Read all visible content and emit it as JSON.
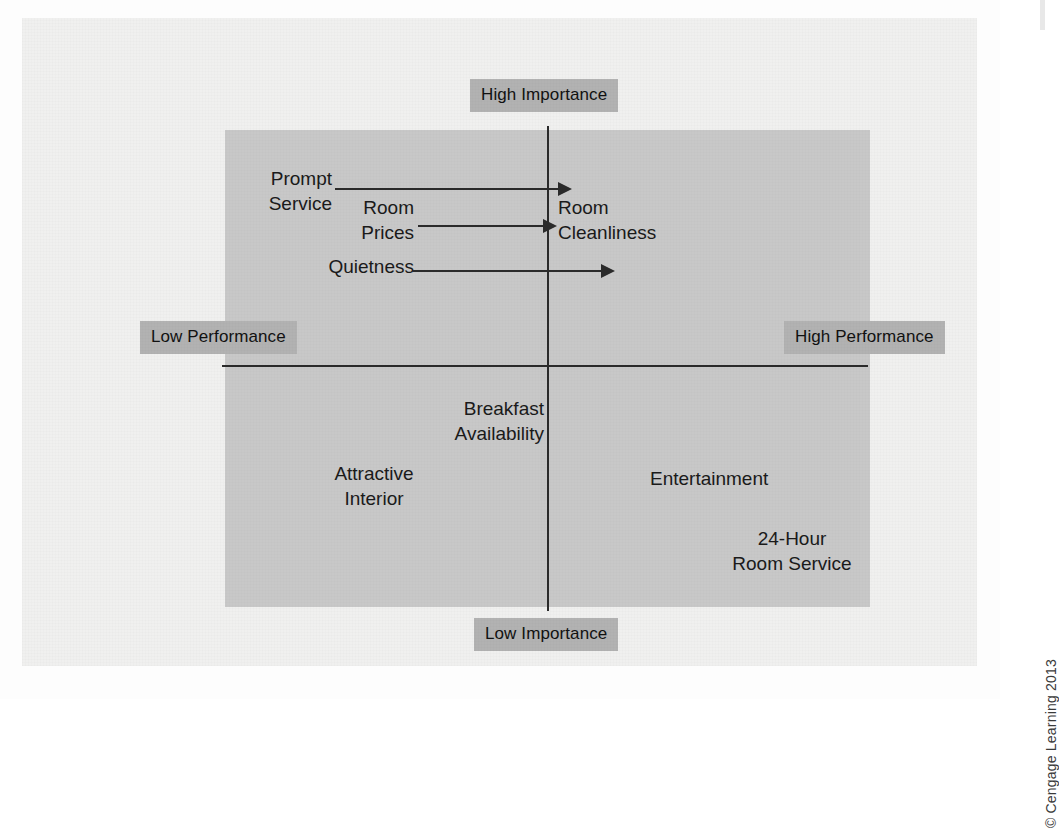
{
  "figure": {
    "copyright": "© Cengage Learning 2013"
  },
  "axes": {
    "vertical_label_top": "High Importance",
    "vertical_label_bottom": "Low Importance",
    "horizontal_label_left": "Low Performance",
    "horizontal_label_right": "High Performance"
  },
  "colors": {
    "page_background": "#f0f0ef",
    "matrix_fill": "#c8c8c8",
    "chip_fill": "#b2b2b2",
    "axis_stroke": "#2b2b2b",
    "text": "#1a1a1a"
  },
  "chart_data": {
    "type": "scatter",
    "xlabel": "Performance",
    "ylabel": "Importance",
    "xlim": [
      "Low Performance",
      "High Performance"
    ],
    "ylim": [
      "Low Importance",
      "High Importance"
    ],
    "grid": false,
    "legend": "none",
    "quadrants": [
      {
        "name": "high-importance-low-performance",
        "position": "upper-left",
        "items": [
          "Prompt Service",
          "Room Prices",
          "Quietness"
        ]
      },
      {
        "name": "high-importance-high-performance",
        "position": "upper-right",
        "items": [
          "Room Cleanliness"
        ]
      },
      {
        "name": "low-importance-low-performance",
        "position": "lower-left",
        "items": [
          "Breakfast Availability",
          "Attractive Interior"
        ]
      },
      {
        "name": "low-importance-high-performance",
        "position": "lower-right",
        "items": [
          "Entertainment",
          "24-Hour Room Service"
        ]
      }
    ],
    "annotations": [
      {
        "from": "Prompt Service",
        "to": "Room Cleanliness",
        "style": "arrow",
        "direction": "right"
      },
      {
        "from": "Room Prices",
        "to": "Room Cleanliness",
        "style": "arrow",
        "direction": "right"
      },
      {
        "from": "Quietness",
        "to": "Room Cleanliness",
        "style": "arrow",
        "direction": "right"
      }
    ]
  },
  "attributes": {
    "prompt_service": "Prompt\nService",
    "prompt_service_line1": "Prompt",
    "prompt_service_line2": "Service",
    "room_prices_line1": "Room",
    "room_prices_line2": "Prices",
    "quietness": "Quietness",
    "room_cleanliness_line1": "Room",
    "room_cleanliness_line2": "Cleanliness",
    "breakfast_line1": "Breakfast",
    "breakfast_line2": "Availability",
    "attractive_line1": "Attractive",
    "attractive_line2": "Interior",
    "entertainment": "Entertainment",
    "room_service_line1": "24-Hour",
    "room_service_line2": "Room Service"
  }
}
